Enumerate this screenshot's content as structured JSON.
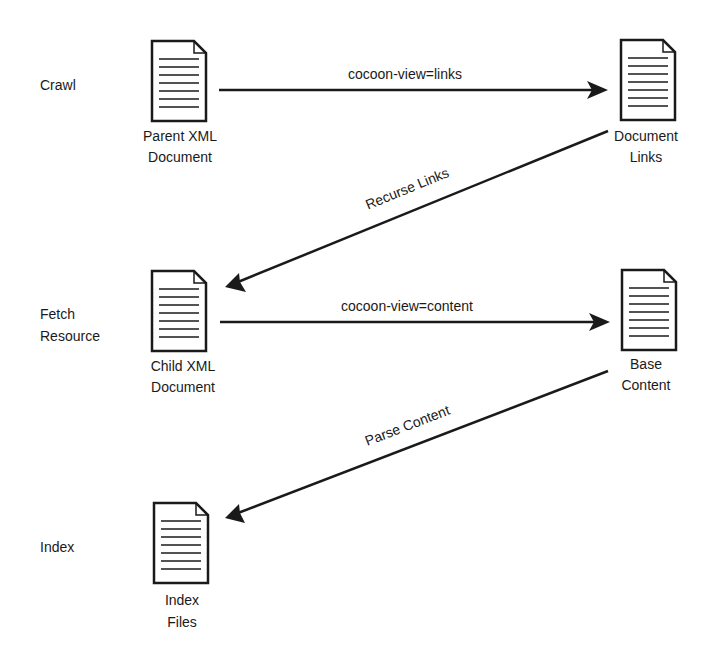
{
  "diagram": {
    "colors": {
      "stroke": "#1a1a1a",
      "background": "#ffffff"
    },
    "stages": [
      {
        "lines": [
          "Crawl"
        ]
      },
      {
        "lines": [
          "Fetch",
          "Resource"
        ]
      },
      {
        "lines": [
          "Index"
        ]
      }
    ],
    "documents": [
      {
        "id": "parent",
        "icon": "document-icon",
        "lines": [
          "Parent XML",
          "Document"
        ]
      },
      {
        "id": "links",
        "icon": "document-icon",
        "lines": [
          "Document",
          "Links"
        ]
      },
      {
        "id": "child",
        "icon": "document-icon",
        "lines": [
          "Child XML",
          "Document"
        ]
      },
      {
        "id": "base",
        "icon": "document-icon",
        "lines": [
          "Base",
          "Content"
        ]
      },
      {
        "id": "index",
        "icon": "document-icon",
        "lines": [
          "Index",
          "Files"
        ]
      }
    ],
    "edges": [
      {
        "from": "parent",
        "to": "links",
        "label": "cocoon-view=links"
      },
      {
        "from": "links",
        "to": "child",
        "label": "Recurse Links"
      },
      {
        "from": "child",
        "to": "base",
        "label": "cocoon-view=content"
      },
      {
        "from": "base",
        "to": "index",
        "label": "Parse Content"
      }
    ]
  }
}
